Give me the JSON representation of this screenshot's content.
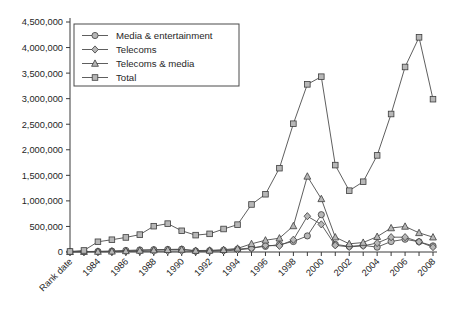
{
  "chart_data": {
    "type": "line",
    "title": "",
    "subtitle": "",
    "xlabel": "",
    "ylabel": "",
    "grid": false,
    "legend_position": "top-left",
    "ylim": [
      0,
      4500000
    ],
    "ytick_labels": [
      "0",
      "500,000",
      "1,000,000",
      "1,500,000",
      "2,000,000",
      "2,500,000",
      "3,000,000",
      "3,500,000",
      "4,000,000",
      "4,500,000"
    ],
    "ytick_values": [
      0,
      500000,
      1000000,
      1500000,
      2000000,
      2500000,
      3000000,
      3500000,
      4000000,
      4500000
    ],
    "categories": [
      "Rank date",
      "1983",
      "1984",
      "1985",
      "1986",
      "1987",
      "1988",
      "1989",
      "1990",
      "1991",
      "1992",
      "1993",
      "1994",
      "1995",
      "1996",
      "1997",
      "1998",
      "1999",
      "2000",
      "2001",
      "2002",
      "2003",
      "2004",
      "2005",
      "2006",
      "2007",
      "2008"
    ],
    "xtick_labels_shown": [
      "Rank date",
      "1984",
      "1986",
      "1988",
      "1990",
      "1992",
      "1994",
      "1996",
      "1998",
      "2000",
      "2002",
      "2004",
      "2006",
      "2008"
    ],
    "series": [
      {
        "name": "Media & entertainment",
        "marker": "circle",
        "values": [
          8000,
          9000,
          12000,
          18000,
          30000,
          40000,
          45000,
          50000,
          55000,
          20000,
          25000,
          35000,
          55000,
          80000,
          110000,
          145000,
          205000,
          315000,
          730000,
          150000,
          110000,
          130000,
          95000,
          205000,
          250000,
          200000,
          120000
        ]
      },
      {
        "name": "Telecoms",
        "marker": "diamond",
        "values": [
          2000,
          3000,
          4000,
          5000,
          8000,
          12000,
          15000,
          18000,
          20000,
          10000,
          14000,
          20000,
          40000,
          70000,
          130000,
          120000,
          240000,
          700000,
          540000,
          130000,
          100000,
          120000,
          175000,
          290000,
          290000,
          200000,
          95000
        ]
      },
      {
        "name": "Telecoms & media",
        "marker": "triangle",
        "values": [
          5000,
          7000,
          10000,
          14000,
          22000,
          30000,
          38000,
          45000,
          50000,
          28000,
          32000,
          45000,
          70000,
          160000,
          230000,
          270000,
          510000,
          1480000,
          1040000,
          290000,
          160000,
          185000,
          300000,
          470000,
          500000,
          375000,
          290000
        ]
      },
      {
        "name": "Total",
        "marker": "square",
        "values": [
          10000,
          30000,
          200000,
          240000,
          285000,
          340000,
          505000,
          555000,
          415000,
          330000,
          355000,
          450000,
          535000,
          930000,
          1130000,
          1640000,
          2510000,
          3280000,
          3430000,
          1700000,
          1200000,
          1375000,
          1890000,
          2700000,
          3620000,
          4200000,
          2990000
        ]
      }
    ]
  },
  "colors": {
    "axis": "#3a3a3a",
    "line": "#4d4d4d",
    "marker_fill": "#b7b7b7",
    "marker_stroke": "#3c3c3c",
    "text": "#1f1f1f",
    "background": "#ffffff"
  }
}
